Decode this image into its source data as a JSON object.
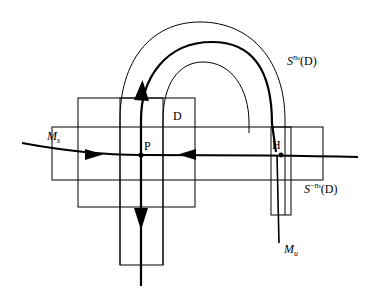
{
  "figure": {
    "background": "#ffffff",
    "stroke_color": "#000000",
    "width": 369,
    "height": 294
  },
  "labels": {
    "point_p": "P",
    "point_h": "H",
    "region_d": "D",
    "manifold_stable_base": "M",
    "manifold_stable_sub": "s",
    "manifold_unstable_base": "M",
    "manifold_unstable_sub": "u",
    "image_forward_base": "S",
    "image_forward_sup_n": "n",
    "image_forward_sup_sub": "u",
    "image_forward_arg": "(D)",
    "image_backward_base": "S",
    "image_backward_sup_minus": "−",
    "image_backward_sup_n": "n",
    "image_backward_sup_sub": "s",
    "image_backward_arg": "(D)"
  },
  "shapes": {
    "square_d": {
      "x": 78,
      "y": 98,
      "w": 117,
      "h": 109,
      "name": "region-d-square"
    },
    "horizontal_strip": {
      "x": 52,
      "y": 127,
      "w": 271,
      "h": 53,
      "name": "backward-image-strip"
    },
    "vertical_strip_p": {
      "x": 120,
      "y": 98,
      "w": 43,
      "h": 167,
      "name": "vertical-strip-through-p"
    },
    "vertical_strip_h": {
      "x": 271,
      "y": 127,
      "w": 20,
      "h": 88,
      "name": "vertical-strip-through-h"
    }
  },
  "points": {
    "p": {
      "x": 141,
      "y": 155
    },
    "h": {
      "x": 281,
      "y": 155
    }
  },
  "curves": {
    "stable_line_y": 155,
    "stable_line_x_start": 22,
    "stable_line_x_end": 358,
    "unstable_vertical_x": 141,
    "unstable_vertical_y_bottom": 286
  },
  "arrows": {
    "stable_right_pointing": {
      "x": 96,
      "y": 155,
      "dir": "right"
    },
    "stable_left_pointing": {
      "x": 186,
      "y": 155,
      "dir": "left"
    },
    "unstable_up_pointing": {
      "x": 141,
      "y": 88,
      "dir": "up"
    },
    "unstable_down_pointing": {
      "x": 141,
      "y": 224,
      "dir": "down"
    }
  }
}
